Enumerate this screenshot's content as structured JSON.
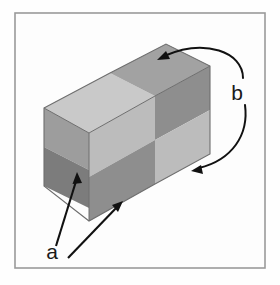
{
  "figure": {
    "background_color": "#fefefe",
    "frame": {
      "name": "figure-border",
      "stroke_color": "#9a9a9a",
      "fill_color": "#fdfdfd",
      "x": 15,
      "y": 13,
      "width": 250,
      "height": 255
    },
    "object": {
      "name": "checkered-box",
      "shape": "rectangular cuboid",
      "projection": "isometric",
      "outline_color": "#6e6e6e",
      "faces": [
        {
          "name": "top-face",
          "tiles": [
            {
              "name": "top-tile-front-left",
              "color": "#c9c9c9",
              "shade": "light"
            },
            {
              "name": "top-tile-back-right",
              "color": "#a2a2a2",
              "shade": "dark"
            }
          ]
        },
        {
          "name": "left-face",
          "tiles": [
            {
              "name": "left-tile-upper",
              "color": "#9d9d9d",
              "shade": "medium"
            },
            {
              "name": "left-tile-lower",
              "color": "#7c7c7c",
              "shade": "dark"
            }
          ]
        },
        {
          "name": "front-right-face",
          "tiles": [
            {
              "name": "front-tile-top-left",
              "color": "#bcbcbc",
              "shade": "light"
            },
            {
              "name": "front-tile-top-right",
              "color": "#8e8e8e",
              "shade": "dark"
            },
            {
              "name": "front-tile-bottom-left",
              "color": "#8e8e8e",
              "shade": "dark"
            },
            {
              "name": "front-tile-bottom-right",
              "color": "#bcbcbc",
              "shade": "light"
            }
          ]
        }
      ]
    },
    "annotations": [
      {
        "name": "label-a",
        "label": "a",
        "x": 52,
        "y": 259,
        "arrow_style": "straight",
        "arrow_color": "#111111",
        "arrow_count": 2,
        "points_to": "left-face and front-left tiles"
      },
      {
        "name": "label-b",
        "label": "b",
        "x": 237,
        "y": 93,
        "arrow_style": "curved",
        "arrow_color": "#111111",
        "arrow_count": 2,
        "points_to": "top-face dark tile and front-right light tile"
      }
    ]
  }
}
